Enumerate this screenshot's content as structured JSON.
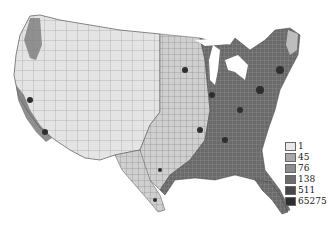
{
  "map": {
    "subject": "United States counties choropleth",
    "style": "grayscale",
    "region_fills": {
      "west_rural": "#e6e6e6",
      "plains": "#d0d0d0",
      "midwest": "#8a8a8a",
      "east": "#5a5a5a",
      "metro": "#333333",
      "county_border": "#777777"
    }
  },
  "legend": {
    "items": [
      {
        "label": "1",
        "color": "#e8e8e8"
      },
      {
        "label": "45",
        "color": "#a8a8a8"
      },
      {
        "label": "76",
        "color": "#8c8c8c"
      },
      {
        "label": "138",
        "color": "#6c6c6c"
      },
      {
        "label": "511",
        "color": "#484848"
      },
      {
        "label": "65275",
        "color": "#2e2e2e"
      }
    ]
  }
}
